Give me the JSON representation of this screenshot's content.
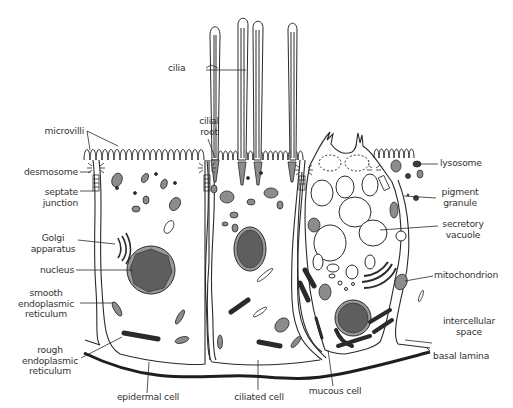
{
  "colors": {
    "line": "#2a2a2a",
    "organelle_fill": "#8c8c8c",
    "nucleus_fill": "#5e5e5e",
    "nucleus_rim": "#9a9a9a",
    "text": "#333333",
    "background": "#ffffff"
  },
  "labels": {
    "cilia": "cilia",
    "cilial_root_1": "cilial",
    "cilial_root_2": "root",
    "microvilli": "microvilli",
    "desmosome": "desmosome",
    "septate_junction_1": "septate",
    "septate_junction_2": "junction",
    "golgi_1": "Golgi",
    "golgi_2": "apparatus",
    "nucleus": "nucleus",
    "ser_1": "smooth",
    "ser_2": "endoplasmic",
    "ser_3": "reticulum",
    "rer_1": "rough",
    "rer_2": "endoplasmic",
    "rer_3": "reticulum",
    "epidermal_cell": "epidermal cell",
    "ciliated_cell": "ciliated cell",
    "mucous_cell": "mucous cell",
    "basal_lamina": "basal lamina",
    "intercellular_1": "intercellular",
    "intercellular_2": "space",
    "mitochondrion": "mitochondrion",
    "secretory_1": "secretory",
    "secretory_2": "vacuole",
    "pigment_1": "pigment",
    "pigment_2": "granule",
    "lysosome": "lysosome"
  }
}
